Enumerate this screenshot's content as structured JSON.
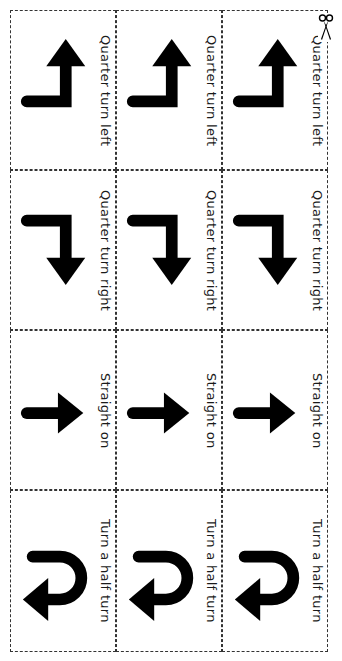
{
  "sheet": {
    "title": "Direction cards",
    "rows": [
      {
        "label": "Quarter turn left",
        "icon": "quarter-turn-left-arrow-icon"
      },
      {
        "label": "Quarter turn right",
        "icon": "quarter-turn-right-arrow-icon"
      },
      {
        "label": "Straight on",
        "icon": "straight-on-arrow-icon"
      },
      {
        "label": "Turn a half turn",
        "icon": "half-turn-arrow-icon"
      }
    ],
    "columns": 3,
    "cut_marker": "scissors-icon",
    "colors": {
      "ink": "#000000",
      "border": "#333333",
      "background": "#ffffff"
    }
  }
}
